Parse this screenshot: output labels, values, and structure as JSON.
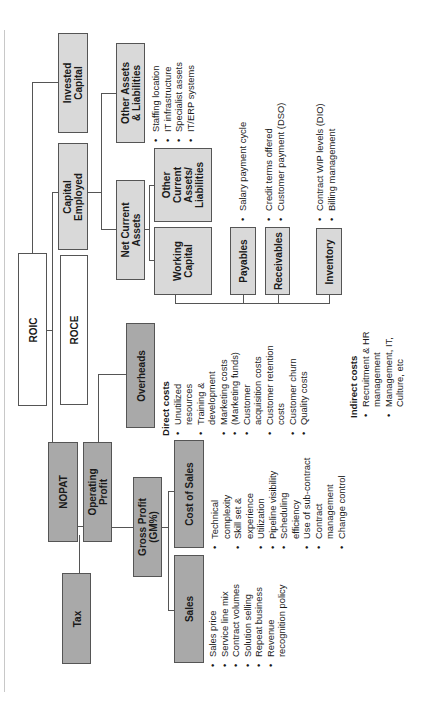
{
  "diagram": {
    "type": "roic-driver-tree",
    "orientation": "rotated-90-ccw",
    "colors": {
      "dark_box": "#a9a9a9",
      "light_box": "#d9d9d9",
      "white_box": "#ffffff",
      "line": "#555555"
    },
    "nodes": {
      "roic": "ROIC",
      "roce": "ROCE",
      "invested_capital": "Invested Capital",
      "capital_employed": "Capital Employed",
      "nopat": "NOPAT",
      "operating_profit": "Operating Profit",
      "tax": "Tax",
      "gross_profit": "Gross Profit (GM%)",
      "overheads": "Overheads",
      "sales": "Sales",
      "cost_of_sales": "Cost of Sales",
      "other_assets": "Other Assets & Liabilities",
      "net_current_assets": "Net Current Assets",
      "other_current": "Other Current Assets/ Liabilities",
      "working_capital": "Working Capital",
      "payables": "Payables",
      "receivables": "Receivables",
      "inventory": "Inventory"
    },
    "node_lines": {
      "invested_capital": [
        "Invested",
        "Capital"
      ],
      "capital_employed": [
        "Capital",
        "Employed"
      ],
      "operating_profit": [
        "Operating",
        "Profit"
      ],
      "gross_profit": [
        "Gross Profit",
        "(GM%)"
      ],
      "other_assets": [
        "Other Assets",
        "& Liabilities"
      ],
      "net_current_assets": [
        "Net Current",
        "Assets"
      ],
      "other_current": [
        "Other",
        "Current",
        "Assets/",
        "Liabilities"
      ],
      "working_capital": [
        "Working",
        "Capital"
      ]
    },
    "drivers": {
      "other_assets": [
        "Staffing location",
        "IT infrastructure",
        "Specialist assets",
        "IT/ERP systems"
      ],
      "payables": [
        "Salary payment cycle"
      ],
      "receivables": [
        "Credit terms offered",
        "Customer payment (DSO)"
      ],
      "inventory": [
        "Contract WIP levels (DIO)",
        "Billing management"
      ],
      "sales": [
        "Sales price",
        "Service line mix",
        "Contract volumes",
        "Solution selling",
        "Repeat business",
        "Revenue recognition policy"
      ],
      "cost_of_sales": [
        "Technical complexity",
        "Skill set & experience",
        "Utilization",
        "Pipeline visibility",
        "Scheduling efficiency",
        "Use of sub-contract",
        "Contract management",
        "Change control"
      ],
      "overheads_direct_heading": "Direct costs",
      "overheads_direct": [
        "Unutilized resources",
        "Training & development",
        "Marketing costs",
        "(Marketing funds)",
        "Customer acquisition costs",
        "Customer retention costs",
        "Customer churn",
        "Quality costs"
      ],
      "overheads_indirect_heading": "Indirect costs",
      "overheads_indirect": [
        "Recruitment & HR management",
        "Management, IT, Culture, etc"
      ]
    }
  }
}
